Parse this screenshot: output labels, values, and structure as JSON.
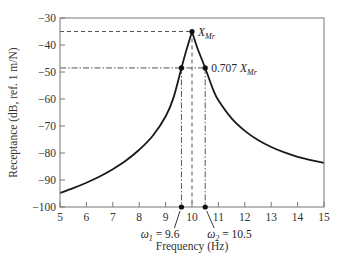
{
  "chart_data": {
    "type": "line",
    "title": "",
    "xlabel": "Frequency (Hz)",
    "ylabel": "Receptance (dB, ref. 1 m/N)",
    "xlim": [
      5,
      15
    ],
    "ylim": [
      -100,
      -30
    ],
    "grid": false,
    "legend": null,
    "xticks": [
      5,
      6,
      7,
      8,
      9,
      10,
      11,
      12,
      13,
      14,
      15
    ],
    "yticks": [
      -30,
      -40,
      -50,
      -60,
      -70,
      -80,
      -90,
      -100
    ],
    "xtick_labels": [
      "5",
      "6",
      "7",
      "8",
      "9",
      "10",
      "11",
      "12",
      "13",
      "14",
      "15"
    ],
    "ytick_labels": [
      "−30",
      "−40",
      "−50",
      "−60",
      "−70",
      "−80",
      "−90",
      "−100"
    ],
    "series": [
      {
        "name": "Receptance",
        "color": "#1a1a1a",
        "x": [
          5.0,
          5.5,
          6.0,
          6.5,
          7.0,
          7.5,
          8.0,
          8.5,
          9.0,
          9.3,
          9.6,
          9.8,
          10.0,
          10.2,
          10.5,
          10.8,
          11.0,
          11.5,
          12.0,
          12.5,
          13.0,
          13.5,
          14.0,
          14.5,
          15.0
        ],
        "y": [
          -94.8,
          -93.0,
          -91.0,
          -88.7,
          -86.0,
          -82.8,
          -78.8,
          -73.8,
          -66.5,
          -59.5,
          -48.5,
          -41.5,
          -35.0,
          -41.0,
          -48.5,
          -56.5,
          -60.5,
          -67.2,
          -71.8,
          -75.2,
          -77.8,
          -79.8,
          -81.4,
          -82.6,
          -83.7
        ]
      }
    ],
    "annotations": [
      {
        "label_main": "X",
        "label_sub": "Mr",
        "x": 10.0,
        "y": -35.0,
        "type": "peak-marker",
        "ref_line": "dashed"
      },
      {
        "label_prefix": "0.707 ",
        "label_main": "X",
        "label_sub": "Mr",
        "x": 10.5,
        "y": -48.5,
        "type": "half-power-level",
        "ref_line": "dash-dot"
      },
      {
        "label_main": "ω",
        "label_sub": "1",
        "label_suffix": " = 9.6",
        "x": 9.6,
        "y": -100,
        "type": "axis-marker"
      },
      {
        "label_main": "ω",
        "label_sub": "2",
        "label_suffix": " = 10.5",
        "x": 10.5,
        "y": -100,
        "type": "axis-marker"
      }
    ]
  }
}
